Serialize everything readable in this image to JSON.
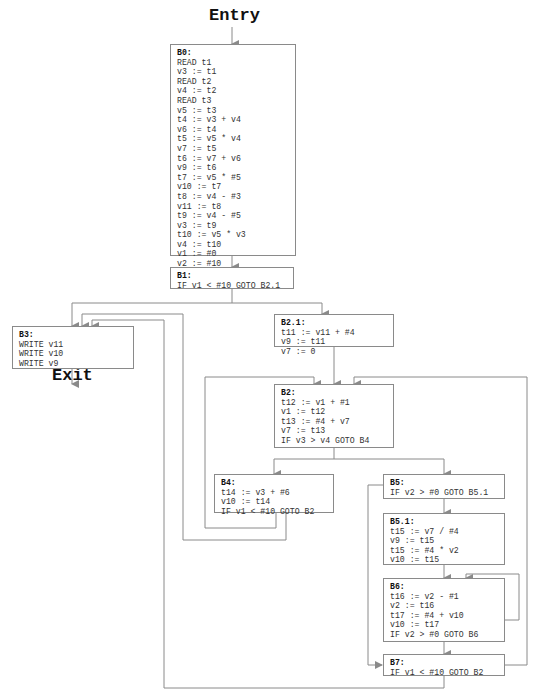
{
  "terminals": {
    "entry": "Entry",
    "exit": "Exit"
  },
  "colors": {
    "edge": "#8a8a8a",
    "border": "#8a8a8a",
    "text": "#333333",
    "background": "#ffffff"
  },
  "blocks": {
    "B0": {
      "label": "B0:",
      "lines": [
        "READ t1",
        "v3 := t1",
        "READ t2",
        "v4 := t2",
        "READ t3",
        "v5 := t3",
        "t4 := v3 + v4",
        "v6 := t4",
        "t5 := v5 * v4",
        "v7 := t5",
        "t6 := v7 + v6",
        "v9 := t6",
        "t7 := v5 * #5",
        "v10 := t7",
        "t8 := v4 - #3",
        "v11 := t8",
        "t9 := v4 - #5",
        "v3 := t9",
        "t10 := v5 * v3",
        "v4 := t10",
        "v1 := #0",
        "v2 := #10"
      ]
    },
    "B1": {
      "label": "B1:",
      "lines": [
        "IF v1 < #10 GOTO B2.1"
      ]
    },
    "B2_1": {
      "label": "B2.1:",
      "lines": [
        "t11 := v11 + #4",
        "v9 := t11",
        "v7 := 0"
      ]
    },
    "B3": {
      "label": "B3:",
      "lines": [
        "WRITE v11",
        "WRITE v10",
        "WRITE v9"
      ]
    },
    "B2": {
      "label": "B2:",
      "lines": [
        "t12 := v1 + #1",
        "v1 := t12",
        "t13 := #4 + v7",
        "v7 := t13",
        "IF v3 > v4 GOTO B4"
      ]
    },
    "B4": {
      "label": "B4:",
      "lines": [
        "t14 := v3 + #6",
        "v10 := t14",
        "IF v1 < #10 GOTO B2"
      ]
    },
    "B5": {
      "label": "B5:",
      "lines": [
        "IF v2 > #0 GOTO B5.1"
      ]
    },
    "B5_1": {
      "label": "B5.1:",
      "lines": [
        "t15 := v7 / #4",
        "v9 := t15",
        "t15 := #4 * v2",
        "v10 := t15"
      ]
    },
    "B6": {
      "label": "B6:",
      "lines": [
        "t16 := v2 - #1",
        "v2 := t16",
        "t17 := #4 + v10",
        "v10 := t17",
        "IF v2 > #0 GOTO B6"
      ]
    },
    "B7": {
      "label": "B7:",
      "lines": [
        "IF v1 < #10 GOTO B2"
      ]
    }
  },
  "edges": [
    {
      "from": "Entry",
      "to": "B0"
    },
    {
      "from": "B0",
      "to": "B1"
    },
    {
      "from": "B1",
      "to": "B2.1"
    },
    {
      "from": "B1",
      "to": "B3"
    },
    {
      "from": "B2.1",
      "to": "B2"
    },
    {
      "from": "B2",
      "to": "B4"
    },
    {
      "from": "B2",
      "to": "B5"
    },
    {
      "from": "B4",
      "to": "B2"
    },
    {
      "from": "B4",
      "to": "B3"
    },
    {
      "from": "B5",
      "to": "B5.1"
    },
    {
      "from": "B5",
      "to": "B7"
    },
    {
      "from": "B5.1",
      "to": "B6"
    },
    {
      "from": "B6",
      "to": "B6"
    },
    {
      "from": "B6",
      "to": "B7"
    },
    {
      "from": "B7",
      "to": "B2"
    },
    {
      "from": "B7",
      "to": "B3"
    },
    {
      "from": "B3",
      "to": "Exit"
    }
  ]
}
